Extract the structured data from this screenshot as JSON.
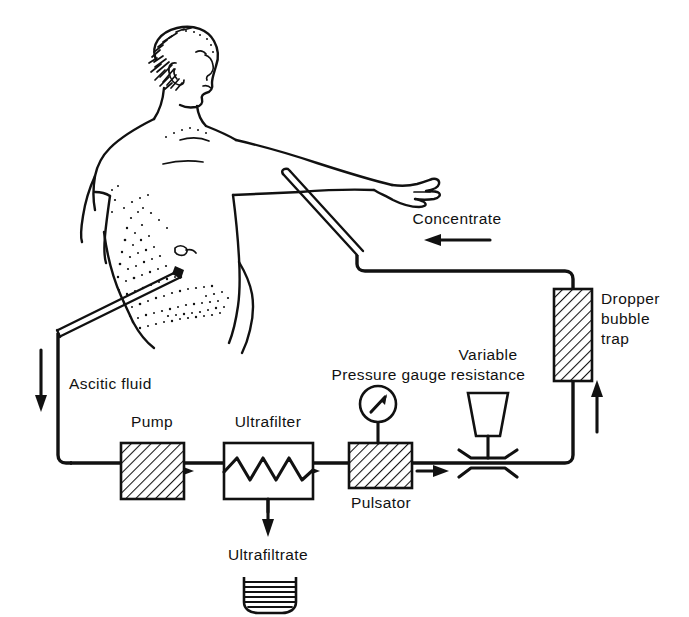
{
  "figure": {
    "type": "medical-schematic-diagram",
    "background_color": "#ffffff",
    "line_color": "#111111",
    "width": 689,
    "height": 617
  },
  "labels": {
    "concentrate": "Concentrate",
    "dropper_line1": "Dropper",
    "dropper_line2": "bubble",
    "dropper_line3": "trap",
    "variable_line1": "Variable",
    "variable_line2": "resistance",
    "pressure_gauge": "Pressure gauge",
    "ascitic_fluid": "Ascitic fluid",
    "pump": "Pump",
    "ultrafilter": "Ultrafilter",
    "pulsator": "Pulsator",
    "ultrafiltrate": "Ultrafiltrate"
  },
  "components": [
    {
      "id": "patient",
      "name": "Patient torso",
      "style": "line-drawing outline, stippled abdomen, right arm outstretched"
    },
    {
      "id": "abdominal-cannula",
      "name": "Abdominal cannula",
      "style": "double-line needle inserted into lower abdomen"
    },
    {
      "id": "arm-cannula",
      "name": "Arm cannula / venous return",
      "style": "double-line needle entering forearm"
    },
    {
      "id": "pump",
      "name": "Pump",
      "style": "hatched rectangle"
    },
    {
      "id": "ultrafilter",
      "name": "Ultrafilter",
      "style": "white rectangle containing sawtooth zigzag membrane"
    },
    {
      "id": "pulsator",
      "name": "Pulsator",
      "style": "hatched rectangle"
    },
    {
      "id": "pressure-gauge",
      "name": "Pressure gauge",
      "style": "circular dial with diagonal needle on a stem"
    },
    {
      "id": "variable-resistance",
      "name": "Variable resistance",
      "style": "screw clamp, inverted trapezoid knob pressing tube"
    },
    {
      "id": "dropper-bubble-trap",
      "name": "Dropper bubble trap",
      "style": "vertical hatched rectangle"
    },
    {
      "id": "ultrafiltrate-beaker",
      "name": "Ultrafiltrate collection beaker",
      "style": "beaker with horizontal fluid fill lines"
    }
  ],
  "flow_arrows": [
    {
      "id": "arrow-concentrate",
      "direction": "left",
      "near": "Concentrate"
    },
    {
      "id": "arrow-ascitic-down",
      "direction": "down",
      "near": "Ascitic fluid"
    },
    {
      "id": "arrow-pump-out",
      "direction": "right",
      "near": "Pump outlet"
    },
    {
      "id": "arrow-filter-out",
      "direction": "right",
      "near": "Ultrafilter outlet"
    },
    {
      "id": "arrow-pulsator-out",
      "direction": "right",
      "near": "Pulsator outlet"
    },
    {
      "id": "arrow-ultrafiltrate-down",
      "direction": "down",
      "near": "Ultrafiltrate"
    },
    {
      "id": "arrow-trap-up",
      "direction": "up",
      "near": "Dropper bubble trap inlet"
    }
  ]
}
